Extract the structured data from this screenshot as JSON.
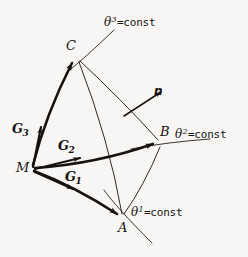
{
  "figure": {
    "kind": "curvilinear-coordinate-diagram",
    "background_color": "#f7f6f4",
    "ink_color": "#16130f",
    "width": 248,
    "height": 257
  },
  "points": {
    "m": {
      "label": "M",
      "x": 32,
      "y": 168
    },
    "a": {
      "label": "A",
      "x": 122,
      "y": 218
    },
    "b": {
      "label": "B",
      "x": 159,
      "y": 143
    },
    "c": {
      "label": "C",
      "x": 76,
      "y": 57
    }
  },
  "vectors": {
    "g1": {
      "label": "G",
      "index": "1"
    },
    "g2": {
      "label": "G",
      "index": "2"
    },
    "g3": {
      "label": "G",
      "index": "3"
    },
    "normal": {
      "label": "n"
    }
  },
  "coordinate_lines": {
    "theta1": {
      "symbol": "θ",
      "superscript": "1",
      "equals": "=const"
    },
    "theta2": {
      "symbol": "θ",
      "superscript": "2",
      "equals": "=const"
    },
    "theta3": {
      "symbol": "θ",
      "superscript": "3",
      "equals": "=const"
    }
  }
}
